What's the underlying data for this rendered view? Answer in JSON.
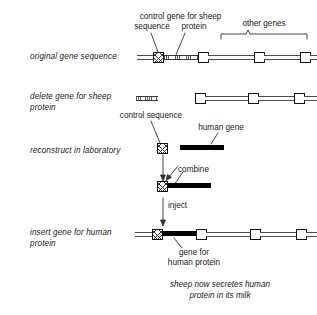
{
  "diagram": {
    "title_caption": "sheep now secretes human\nprotein in its milk",
    "rows": [
      {
        "id": "original",
        "label": "original gene sequence"
      },
      {
        "id": "delete",
        "label": "delete gene for sheep\nprotein"
      },
      {
        "id": "reconstruct",
        "label": "reconstruct in laboratory"
      },
      {
        "id": "insert",
        "label": "insert gene for human\nprotein"
      }
    ],
    "annotations": {
      "control_sequence_top": "control\nsequence",
      "gene_for_sheep_protein": "gene for sheep\nprotein",
      "other_genes": "other genes",
      "control_sequence_mid": "control sequence",
      "human_gene": "human gene",
      "combine": "combine",
      "inject": "inject",
      "gene_for_human_protein": "gene for\nhuman protein"
    },
    "colors": {
      "ink": "#1a1a1a",
      "strand": "#4a4a4a",
      "human_gene_fill": "#000000",
      "background": "#ffffff"
    }
  }
}
